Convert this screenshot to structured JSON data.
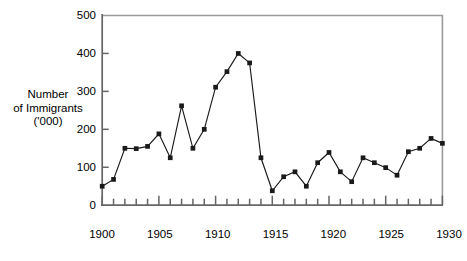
{
  "chart_data": {
    "type": "line",
    "title": "",
    "xlabel": "",
    "ylabel": "Number of Immigrants ('000)",
    "ylabel_lines": [
      "Number",
      "of Immigrants",
      "('000)"
    ],
    "xlim": [
      1900,
      1930
    ],
    "ylim": [
      0,
      500
    ],
    "grid": false,
    "legend": false,
    "markers": "filled-square",
    "line_color": "#1a1a1a",
    "marker_color": "#1a1a1a",
    "axis_color": "#555555",
    "frame_color": "#9a9a9a",
    "y_ticks": [
      0,
      100,
      200,
      300,
      400,
      500
    ],
    "y_tick_labels": [
      "0",
      "100",
      "200",
      "300",
      "400",
      "500"
    ],
    "x_ticks": [
      1900,
      1901,
      1902,
      1903,
      1904,
      1905,
      1906,
      1907,
      1908,
      1909,
      1910,
      1911,
      1912,
      1913,
      1914,
      1915,
      1916,
      1917,
      1918,
      1919,
      1920,
      1921,
      1922,
      1923,
      1924,
      1925,
      1926,
      1927,
      1928,
      1929,
      1930
    ],
    "x_tick_labels_major": [
      "1900",
      "1905",
      "1910",
      "1915",
      "1920",
      "1925",
      "1930"
    ],
    "x_ticks_major": [
      1900,
      1905,
      1910,
      1915,
      1920,
      1925,
      1930
    ],
    "x": [
      1900,
      1901,
      1902,
      1903,
      1904,
      1905,
      1906,
      1907,
      1908,
      1909,
      1910,
      1911,
      1912,
      1913,
      1914,
      1915,
      1916,
      1917,
      1918,
      1919,
      1920,
      1921,
      1922,
      1923,
      1924,
      1925,
      1926,
      1927,
      1928,
      1929,
      1930
    ],
    "values": [
      50,
      68,
      150,
      149,
      155,
      188,
      125,
      262,
      150,
      200,
      311,
      352,
      400,
      375,
      125,
      38,
      75,
      88,
      50,
      112,
      139,
      88,
      62,
      125,
      112,
      99,
      79,
      141,
      150,
      176,
      163
    ],
    "series": [
      {
        "name": "Number of Immigrants ('000)",
        "values": [
          50,
          68,
          150,
          149,
          155,
          188,
          125,
          262,
          150,
          200,
          311,
          352,
          400,
          375,
          125,
          38,
          75,
          88,
          50,
          112,
          139,
          88,
          62,
          125,
          112,
          99,
          79,
          141,
          150,
          176,
          163
        ]
      }
    ]
  }
}
